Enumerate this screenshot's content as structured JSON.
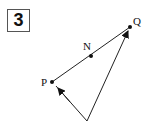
{
  "figure": {
    "number": "3",
    "points": [
      {
        "label": "Q",
        "x": 130,
        "y": 27
      },
      {
        "label": "N",
        "x": 91,
        "y": 56
      },
      {
        "label": "P",
        "x": 52,
        "y": 82
      },
      {
        "label": "",
        "x": 87,
        "y": 121
      }
    ],
    "segments": [
      {
        "from": "P",
        "to": "Q",
        "arrow": false
      },
      {
        "from": "O",
        "to": "P",
        "arrow": true
      },
      {
        "from": "O",
        "to": "Q",
        "arrow": true
      }
    ],
    "labels": {
      "Q": "Q",
      "N": "N",
      "P": "P"
    },
    "line_color": "#222222"
  }
}
